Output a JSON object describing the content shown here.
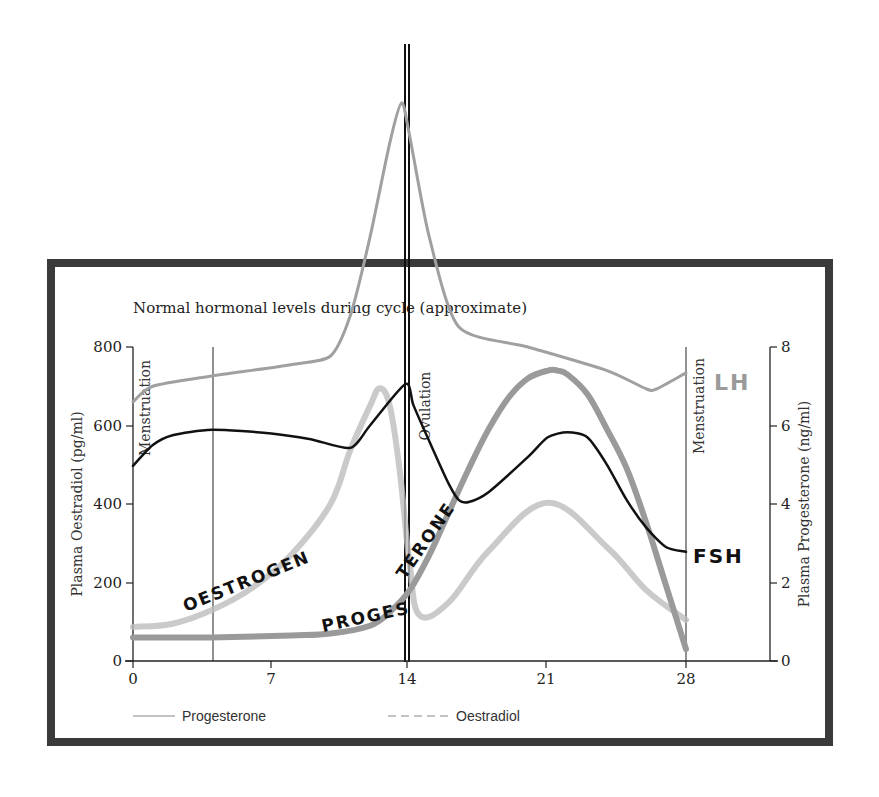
{
  "chart_data": {
    "type": "line",
    "title": "Normal hormonal levels during cycle (approximate)",
    "xlabel": "",
    "x_ticks": [
      0,
      7,
      14,
      21,
      28
    ],
    "xlim": [
      0,
      32
    ],
    "left_axis": {
      "label": "Plasma Oestradiol (pg/ml)",
      "ticks": [
        0,
        200,
        400,
        600,
        800
      ],
      "ylim": [
        0,
        800
      ]
    },
    "right_axis": {
      "label": "Plasma Progesterone (ng/ml)",
      "ticks": [
        0,
        2,
        4,
        6,
        8
      ],
      "ylim": [
        0,
        8
      ]
    },
    "grid": false,
    "legend_position": "bottom",
    "legend": [
      {
        "label": "Progesterone",
        "style": "solid"
      },
      {
        "label": "Oestradiol",
        "style": "dashed"
      }
    ],
    "vertical_markers": [
      {
        "x": 0,
        "label": "Menstruation"
      },
      {
        "x": 4,
        "label": ""
      },
      {
        "x": 14,
        "label": "Ovulation"
      },
      {
        "x": 28,
        "label": "Menstruation"
      }
    ],
    "series": [
      {
        "name": "Oestradiol",
        "annotation": "OESTROGEN",
        "axis": "left",
        "color": "#bdbdbd",
        "x": [
          0,
          2,
          4,
          6,
          8,
          10,
          11,
          12,
          12.5,
          13,
          13.5,
          14,
          14.5,
          16,
          18,
          21,
          24,
          26,
          28
        ],
        "values": [
          87,
          95,
          130,
          185,
          270,
          400,
          537,
          650,
          695,
          650,
          487,
          250,
          117,
          150,
          280,
          403,
          290,
          180,
          105
        ]
      },
      {
        "name": "Progesterone",
        "annotation": "PROGESTERONE",
        "axis": "right",
        "color": "#9a9a9a",
        "x": [
          0,
          4,
          8,
          10,
          12,
          13,
          14,
          15,
          16,
          17,
          18,
          19,
          20,
          21,
          21.5,
          22,
          23,
          24,
          25,
          26,
          27,
          28
        ],
        "values": [
          0.6,
          0.6,
          0.65,
          0.7,
          0.9,
          1.25,
          1.8,
          2.7,
          3.8,
          4.9,
          5.9,
          6.7,
          7.2,
          7.4,
          7.4,
          7.3,
          6.8,
          5.9,
          4.9,
          3.5,
          1.9,
          0.3
        ]
      },
      {
        "name": "LH",
        "annotation": "LH",
        "axis": "left",
        "color": "#a0a0a0",
        "hand_drawn": true,
        "x": [
          0,
          1,
          4,
          8,
          10,
          11,
          12,
          13,
          13.6,
          14,
          15,
          16.5,
          20,
          24,
          26,
          26.5,
          28
        ],
        "values": [
          660,
          700,
          726,
          755,
          777,
          880,
          1080,
          1320,
          1422,
          1340,
          1080,
          851,
          800,
          740,
          693,
          693,
          734
        ]
      },
      {
        "name": "FSH",
        "annotation": "FSH",
        "axis": "left",
        "color": "#111111",
        "hand_drawn": true,
        "x": [
          0,
          1,
          2,
          4,
          7,
          9,
          11,
          12,
          13.8,
          14.2,
          15,
          16,
          16.5,
          17,
          18,
          20,
          21,
          22,
          23,
          24,
          25,
          26,
          27,
          28
        ],
        "values": [
          497,
          550,
          575,
          589,
          580,
          565,
          543,
          600,
          706,
          652,
          560,
          450,
          410,
          405,
          430,
          520,
          570,
          583,
          570,
          500,
          410,
          339,
          290,
          278
        ]
      }
    ]
  },
  "labels": {
    "title": "Normal hormonal levels during cycle (approximate)",
    "y_left_title": "Plasma Oestradiol (pg/ml)",
    "y_right_title": "Plasma Progesterone (ng/ml)",
    "y_left_ticks": [
      "0",
      "200",
      "400",
      "600",
      "800"
    ],
    "y_right_ticks": [
      "0",
      "2",
      "4",
      "6",
      "8"
    ],
    "x_ticks": [
      "0",
      "7",
      "14",
      "21",
      "28"
    ],
    "menstruation_start": "Menstruation",
    "ovulation": "Ovulation",
    "menstruation_end": "Menstruation",
    "legend_progesterone": "Progesterone",
    "legend_oestradiol": "Oestradiol",
    "hand_oestrogen": "OESTROGEN",
    "hand_progesterone": "PROGESTERONE",
    "hand_lh": "LH",
    "hand_fsh": "FSH"
  }
}
